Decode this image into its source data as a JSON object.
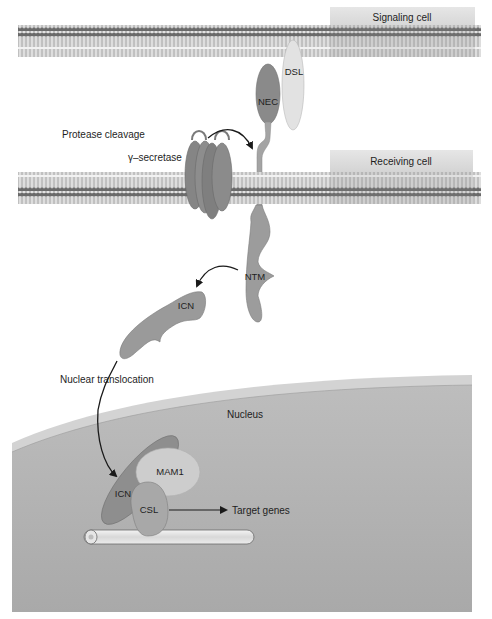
{
  "diagram": {
    "regions": {
      "signaling_cell": "Signaling cell",
      "receiving_cell": "Receiving cell",
      "nucleus": "Nucleus"
    },
    "proteins": {
      "nec": "NEC",
      "dsl": "DSL",
      "ntm": "NTM",
      "icn_cytoplasm": "ICN",
      "icn_nucleus": "ICN",
      "mam1": "MAM1",
      "csl": "CSL"
    },
    "annotations": {
      "protease_cleavage": "Protease cleavage",
      "gamma_secretase": "γ–secretase",
      "nuclear_translocation": "Nuclear translocation",
      "target_genes": "Target genes"
    },
    "colors": {
      "membrane_head": "#6e6e6e",
      "membrane_tail": "#a8a8a8",
      "label_box": "#dcdcdc",
      "protein_dark": "#8a8a8a",
      "protein_mid": "#9c9c9c",
      "protein_light": "#d6d6d6",
      "nucleus_fill": "#b4b4b4",
      "nucleus_envelope": "#d2d2d2",
      "dna": "#e8e8e8"
    }
  }
}
